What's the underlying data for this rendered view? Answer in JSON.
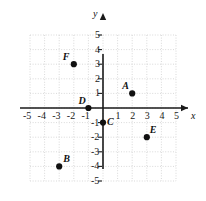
{
  "figure": {
    "kind": "coordinate-plane",
    "background_color": "#ffffff",
    "axis_color": "#1a1a1a",
    "grid_color": "#cfcfcf",
    "point_color": "#111111",
    "x_axis_name": "x",
    "y_axis_name": "y"
  },
  "chart_data": {
    "type": "scatter",
    "title": "",
    "xlabel": "x",
    "ylabel": "y",
    "xlim": [
      -5,
      5
    ],
    "ylim": [
      -5,
      5
    ],
    "grid": true,
    "legend": "none",
    "x_ticks": [
      -5,
      -4,
      -3,
      -2,
      -1,
      1,
      2,
      3,
      4,
      5
    ],
    "y_ticks": [
      5,
      4,
      3,
      2,
      1,
      -1,
      -2,
      -3,
      -4,
      -5
    ],
    "x_tick_labels": [
      "-5",
      "-4",
      "-3",
      "-2",
      "-1",
      "1",
      "2",
      "3",
      "4",
      "5"
    ],
    "y_tick_labels": [
      "5",
      "4",
      "3",
      "2",
      "1",
      "-1",
      "-2",
      "-3",
      "-4",
      "-5"
    ],
    "points": [
      {
        "label": "A",
        "x": 2,
        "y": 1,
        "label_dx": -10,
        "label_dy": -12
      },
      {
        "label": "B",
        "x": -3,
        "y": -4,
        "label_dx": 4,
        "label_dy": -12
      },
      {
        "label": "C",
        "x": 0,
        "y": -1,
        "label_dx": 4,
        "label_dy": -6
      },
      {
        "label": "D",
        "x": -1,
        "y": 0,
        "label_dx": -10,
        "label_dy": -12
      },
      {
        "label": "E",
        "x": 3,
        "y": -2,
        "label_dx": 3,
        "label_dy": -12
      },
      {
        "label": "F",
        "x": -2,
        "y": 3,
        "label_dx": -11,
        "label_dy": -12
      }
    ]
  }
}
